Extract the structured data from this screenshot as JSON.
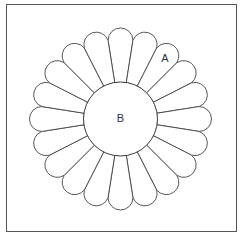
{
  "title": "",
  "diagram": {
    "type": "dresden-plate-quilt-block",
    "frame": {
      "x": 6.5,
      "y": 4.5,
      "width": 230,
      "height": 227,
      "stroke": "#555555"
    },
    "center": {
      "cx": 120.5,
      "cy": 119
    },
    "petal_count": 20,
    "inner_radius": 37,
    "outer_radius": 92,
    "stroke": "#444444",
    "fill": "#ffffff",
    "labels": [
      {
        "id": "A",
        "text": "A",
        "x": 165,
        "y": 62,
        "describes": "petal piece"
      },
      {
        "id": "B",
        "text": "B",
        "x": 120.5,
        "y": 122,
        "describes": "center circle"
      }
    ]
  }
}
